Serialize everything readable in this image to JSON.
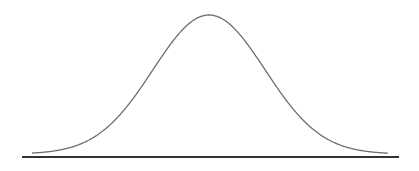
{
  "diagram": {
    "type": "normal-distribution-curve",
    "curve": {
      "color": "#6e6e6e",
      "stroke_width": 1.3,
      "x_start": 32,
      "x_end": 388,
      "peak_x": 209,
      "peak_y": 15,
      "baseline_y": 154,
      "sigma_px": 56
    },
    "baseline": {
      "color": "#333333",
      "stroke_width": 1.8,
      "x1": 22,
      "x2": 399,
      "y": 157
    }
  }
}
